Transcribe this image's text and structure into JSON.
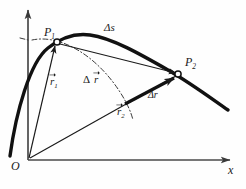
{
  "figure": {
    "type": "physics-vector-diagram",
    "background_color": "#fefefe",
    "ink_color": "#1a1a1a"
  },
  "axes": {
    "x_label": "x",
    "origin_label": "O",
    "x_axis_name": "horizontal-axis",
    "y_axis_name": "vertical-axis",
    "grid": false
  },
  "points": [
    {
      "id": "P1",
      "base": "P",
      "subscript": "1",
      "marker": "open-circle"
    },
    {
      "id": "P2",
      "base": "P",
      "subscript": "2",
      "marker": "open-circle"
    }
  ],
  "labels": {
    "P1_base": "P",
    "P1_sub": "1",
    "P2_base": "P",
    "P2_sub": "2",
    "arc_length": "Δs",
    "delta_symbol": "Δ",
    "r1_base": "r",
    "r1_sub": "1",
    "r2_base": "r",
    "r2_sub": "2",
    "delta_r_vector_base": "r",
    "delta_r_scalar": "Δr",
    "origin": "O",
    "x_axis": "x"
  },
  "vectors": [
    {
      "name": "r1",
      "from": "O",
      "to": "P1",
      "style": "thin-arrow",
      "vector_notation": true
    },
    {
      "name": "r2",
      "from": "O",
      "to": "P2",
      "style": "thin-arrow",
      "vector_notation": true
    },
    {
      "name": "delta-r-vector",
      "from": "P1",
      "to": "P2",
      "style": "thin-arrow",
      "vector_notation": true
    },
    {
      "name": "delta-r-scalar",
      "from": "arc-intersection",
      "to": "P2",
      "style": "bold-arrow",
      "vector_notation": false
    }
  ],
  "curves": [
    {
      "name": "trajectory",
      "style": "thick-solid"
    },
    {
      "name": "radius-arc",
      "style": "dash-dot",
      "center": "O",
      "radius_ref": "r1"
    }
  ]
}
